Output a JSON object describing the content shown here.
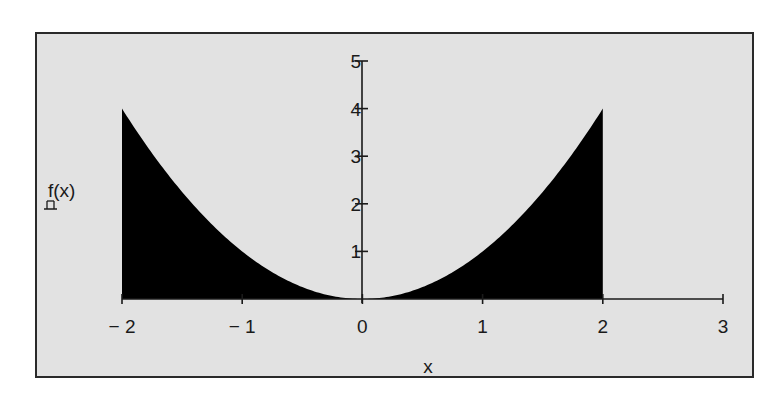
{
  "chart_data": {
    "type": "area",
    "title": "",
    "function": "f(x) = x^2",
    "xlabel": "x",
    "ylabel": "f(x)",
    "ylabel_placeholder": "□",
    "xlim": [
      -2,
      3
    ],
    "ylim": [
      0,
      5
    ],
    "x_ticks": [
      -2,
      -1,
      0,
      1,
      2,
      3
    ],
    "x_tick_labels": [
      "− 2",
      "− 1",
      "0",
      "1",
      "2",
      "3"
    ],
    "y_ticks": [
      1,
      2,
      3,
      4,
      5
    ],
    "y_tick_labels": [
      "1",
      "2",
      "3",
      "4",
      "5"
    ],
    "grid": false,
    "legend": null,
    "fill_color": "#000000",
    "background_color": "#e2e2e2",
    "series": [
      {
        "name": "f(x)",
        "fill": "area-to-axis",
        "domain": [
          -2,
          2
        ],
        "x": [
          -2,
          -1.75,
          -1.5,
          -1.25,
          -1,
          -0.75,
          -0.5,
          -0.25,
          0,
          0.25,
          0.5,
          0.75,
          1,
          1.25,
          1.5,
          1.75,
          2
        ],
        "y": [
          4,
          3.0625,
          2.25,
          1.5625,
          1,
          0.5625,
          0.25,
          0.0625,
          0,
          0.0625,
          0.25,
          0.5625,
          1,
          1.5625,
          2.25,
          3.0625,
          4
        ]
      }
    ]
  }
}
